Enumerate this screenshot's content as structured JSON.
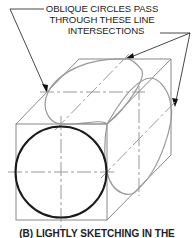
{
  "annotation": {
    "lines": [
      "OBLIQUE CIRCLES PASS",
      "THROUGH THESE LINE",
      "INTERSECTIONS"
    ]
  },
  "caption": "(B) LIGHTLY SKETCHING IN THE",
  "colors": {
    "construction_lines": "#888888",
    "oblique_circles": "#999999",
    "front_circle": "#1a1a1a",
    "text": "#222222"
  }
}
